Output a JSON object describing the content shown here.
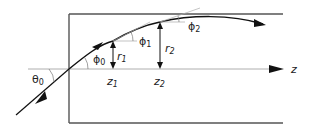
{
  "diagram": {
    "labels": {
      "theta0": "θ",
      "theta0_sub": "0",
      "phi0": "ϕ",
      "phi0_sub": "0",
      "phi1": "ϕ",
      "phi1_sub": "1",
      "phi2": "ϕ",
      "phi2_sub": "2",
      "r1": "r",
      "r1_sub": "1",
      "r2": "r",
      "r2_sub": "2",
      "z1": "z",
      "z1_sub": "1",
      "z2": "z",
      "z2_sub": "2",
      "z_axis": "z"
    },
    "colors": {
      "stroke": "#222222",
      "box": "#444444",
      "axis": "#888888",
      "tangent": "#999999"
    }
  }
}
